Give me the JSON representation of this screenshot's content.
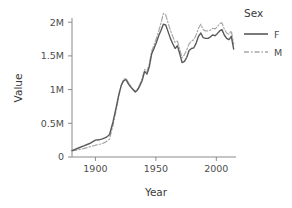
{
  "chart_data": {
    "type": "line",
    "title": "",
    "xlabel": "Year",
    "ylabel": "Value",
    "xlim": [
      1880,
      2020
    ],
    "ylim": [
      0,
      2200000
    ],
    "grid": false,
    "legend_position": "right",
    "legend_title": "Sex",
    "x_ticks": [
      1900,
      1950,
      2000
    ],
    "x_tick_labels": [
      "1900",
      "1950",
      "2000"
    ],
    "y_ticks": [
      0,
      500000,
      1000000,
      1500000,
      2000000
    ],
    "y_tick_labels": [
      "0",
      "0.5M",
      "1M",
      "1.5M",
      "2M"
    ],
    "series": [
      {
        "name": "F",
        "style": "solid",
        "color": "#595959",
        "x": [
          1880,
          1885,
          1890,
          1895,
          1900,
          1903,
          1906,
          1909,
          1912,
          1915,
          1918,
          1920,
          1922,
          1924,
          1926,
          1928,
          1930,
          1932,
          1934,
          1936,
          1938,
          1940,
          1942,
          1944,
          1946,
          1948,
          1950,
          1952,
          1954,
          1956,
          1958,
          1960,
          1962,
          1964,
          1966,
          1968,
          1970,
          1972,
          1974,
          1976,
          1978,
          1980,
          1982,
          1984,
          1986,
          1988,
          1990,
          1992,
          1994,
          1996,
          1998,
          2000,
          2002,
          2004,
          2006,
          2008,
          2010,
          2012,
          2014,
          2016,
          2018
        ],
        "y": [
          95000,
          130000,
          165000,
          200000,
          250000,
          255000,
          270000,
          290000,
          330000,
          520000,
          760000,
          930000,
          1060000,
          1130000,
          1150000,
          1090000,
          1040000,
          1000000,
          965000,
          995000,
          1060000,
          1140000,
          1270000,
          1230000,
          1340000,
          1530000,
          1610000,
          1700000,
          1800000,
          1880000,
          1970000,
          1960000,
          1860000,
          1760000,
          1680000,
          1610000,
          1650000,
          1530000,
          1400000,
          1420000,
          1480000,
          1580000,
          1610000,
          1620000,
          1690000,
          1790000,
          1840000,
          1770000,
          1760000,
          1760000,
          1780000,
          1810000,
          1800000,
          1830000,
          1870000,
          1890000,
          1810000,
          1760000,
          1740000,
          1790000,
          1600000
        ]
      },
      {
        "name": "M",
        "style": "dashdot",
        "color": "#a8a8a8",
        "x": [
          1880,
          1885,
          1890,
          1895,
          1900,
          1903,
          1906,
          1909,
          1912,
          1915,
          1918,
          1920,
          1922,
          1924,
          1926,
          1928,
          1930,
          1932,
          1934,
          1936,
          1938,
          1940,
          1942,
          1944,
          1946,
          1948,
          1950,
          1952,
          1954,
          1956,
          1958,
          1960,
          1962,
          1964,
          1966,
          1968,
          1970,
          1972,
          1974,
          1976,
          1978,
          1980,
          1982,
          1984,
          1986,
          1988,
          1990,
          1992,
          1994,
          1996,
          1998,
          2000,
          2002,
          2004,
          2006,
          2008,
          2010,
          2012,
          2014,
          2016,
          2018
        ],
        "y": [
          90000,
          105000,
          125000,
          150000,
          175000,
          185000,
          200000,
          225000,
          265000,
          470000,
          720000,
          910000,
          1060000,
          1150000,
          1170000,
          1110000,
          1060000,
          1010000,
          975000,
          1010000,
          1080000,
          1170000,
          1300000,
          1270000,
          1380000,
          1570000,
          1660000,
          1760000,
          1870000,
          1990000,
          2130000,
          2110000,
          1990000,
          1880000,
          1790000,
          1700000,
          1720000,
          1600000,
          1470000,
          1520000,
          1590000,
          1680000,
          1720000,
          1740000,
          1810000,
          1910000,
          1970000,
          1890000,
          1870000,
          1870000,
          1880000,
          1910000,
          1900000,
          1930000,
          1980000,
          1990000,
          1900000,
          1840000,
          1820000,
          1870000,
          1680000
        ]
      }
    ]
  },
  "legend": {
    "title": "Sex",
    "items": [
      {
        "label": "F",
        "style": "solid"
      },
      {
        "label": "M",
        "style": "dashdot"
      }
    ]
  },
  "axes": {
    "x_title": "Year",
    "y_title": "Value"
  },
  "colors": {
    "series_f": "#595959",
    "series_m": "#a8a8a8",
    "axis": "#8a8a8a",
    "text": "#4d4d4d",
    "background": "#ffffff"
  }
}
